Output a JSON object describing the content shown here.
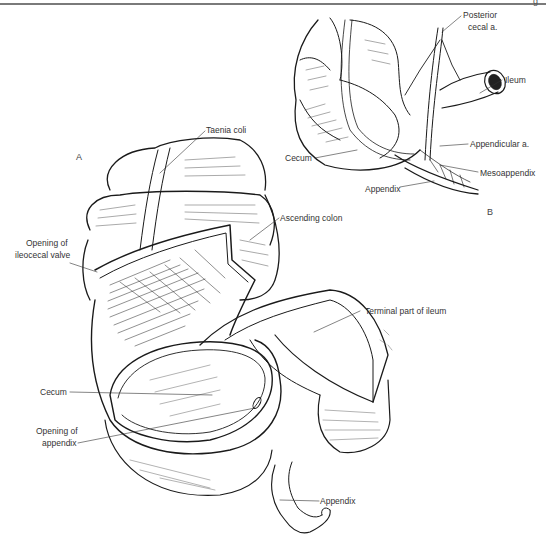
{
  "figure": {
    "header_mark": "g",
    "panel_a": {
      "letter": "A",
      "labels": {
        "taenia_coli": "Taenia coli",
        "ascending_colon": "Ascending colon",
        "opening_ileocecal_1": "Opening of",
        "opening_ileocecal_2": "ileocecal valve",
        "terminal_ileum": "Terminal part of ileum",
        "cecum": "Cecum",
        "opening_appendix_1": "Opening of",
        "opening_appendix_2": "appendix",
        "appendix": "Appendix"
      }
    },
    "panel_b": {
      "letter": "B",
      "labels": {
        "posterior_cecal_1": "Posterior",
        "posterior_cecal_2": "cecal a.",
        "ileum": "Ileum",
        "cecum": "Cecum",
        "appendicular_a": "Appendicular a.",
        "mesoappendix": "Mesoappendix",
        "appendix": "Appendix"
      }
    },
    "colors": {
      "ink": "#1a1a1a",
      "label_text": "#333333",
      "rule": "#7a7a7a",
      "background": "#ffffff"
    }
  }
}
